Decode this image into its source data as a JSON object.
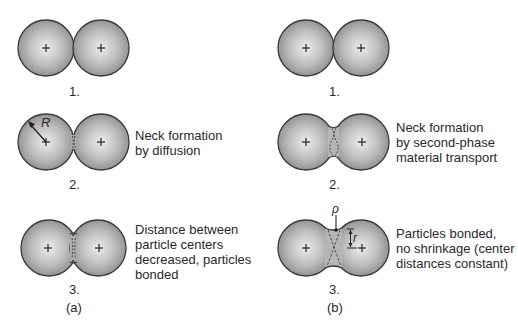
{
  "panels": {
    "a": {
      "label": "(a)",
      "steps": [
        {
          "number": "1.",
          "description": ""
        },
        {
          "number": "2.",
          "description_lines": [
            "Neck formation",
            "by diffusion"
          ]
        },
        {
          "number": "3.",
          "description_lines": [
            "Distance between",
            "particle centers",
            "decreased, particles",
            "bonded"
          ]
        }
      ],
      "radius_symbol": "R"
    },
    "b": {
      "label": "(b)",
      "steps": [
        {
          "number": "1.",
          "description": ""
        },
        {
          "number": "2.",
          "description_lines": [
            "Neck formation",
            "by second-phase",
            "material transport"
          ]
        },
        {
          "number": "3.",
          "description_lines": [
            "Particles bonded,",
            "no shrinkage (center",
            "distances constant)"
          ]
        }
      ],
      "rho_symbol": "ρ",
      "r_symbol": "r"
    }
  },
  "colors": {
    "sphere_edge": "#3a3a3a",
    "sphere_center": "#ededed",
    "sphere_outer": "#8c8c8c"
  }
}
